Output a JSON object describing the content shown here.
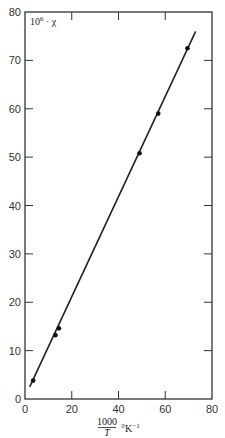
{
  "chart_data": {
    "type": "scatter",
    "title": "",
    "xlabel": "1000/T °K⁻¹",
    "xlabel_parts": {
      "numerator": "1000",
      "denominator": "T",
      "unit": "°K",
      "exponent": "−1"
    },
    "ylabel": "10⁶·χ",
    "ylabel_parts": {
      "base": "10",
      "exp": "6",
      "rest": "· χ"
    },
    "xlim": [
      0,
      80
    ],
    "ylim": [
      0,
      80
    ],
    "xticks": [
      0,
      20,
      40,
      60,
      80
    ],
    "yticks": [
      0,
      10,
      20,
      30,
      40,
      50,
      60,
      70,
      80
    ],
    "grid": false,
    "legend": null,
    "series": [
      {
        "name": "measured",
        "type": "scatter",
        "x": [
          3.5,
          13.0,
          14.5,
          49.0,
          57.0,
          69.5
        ],
        "y": [
          3.8,
          13.2,
          14.6,
          50.8,
          59.0,
          72.5
        ]
      },
      {
        "name": "fit",
        "type": "line",
        "x": [
          2.0,
          73.0
        ],
        "y": [
          2.5,
          76.0
        ]
      }
    ]
  }
}
